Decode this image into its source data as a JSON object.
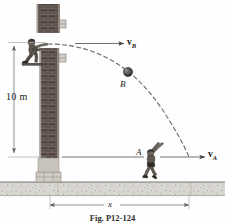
{
  "figure": {
    "caption": "Fig. P12-124",
    "type": "physics-projectile-diagram"
  },
  "labels": {
    "height_dimension": "10 m",
    "horizontal_dimension": "x",
    "point_b": "B",
    "point_a": "A",
    "velocity_b_symbol": "v",
    "velocity_b_sub": "B",
    "velocity_a_symbol": "v",
    "velocity_a_sub": "A"
  },
  "colors": {
    "line": "#4a4a4a",
    "brick_dark": "#4f4440",
    "brick_light": "#7b6a62",
    "ground": "#d6d4cf",
    "ground_speck": "#8a8880",
    "text": "#1a1a1a",
    "trajectory": "#6b6b6b",
    "wall_edge": "#b9b4ac"
  },
  "geometry": {
    "wall_top_y": 42,
    "ground_y": 182,
    "a_level_y": 157,
    "x_dim_left": 49,
    "x_dim_right": 190
  },
  "elements": {
    "thrower": "person-throwing",
    "catcher": "person-catching",
    "ball": "ball-at-b",
    "wall": "brick-wall",
    "ground_name": "ground-hatching",
    "trajectory_name": "dashed-parabolic-trajectory"
  }
}
